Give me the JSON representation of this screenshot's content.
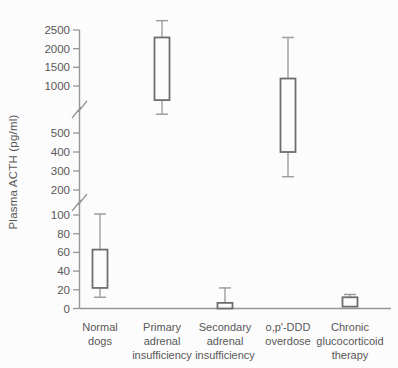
{
  "chart_data": {
    "type": "boxplot",
    "title": "",
    "xlabel": "",
    "ylabel": "Plasma ACTH (pg/ml)",
    "unit": "pg/ml",
    "grid": false,
    "legend": null,
    "categories": [
      "Normal dogs",
      "Primary adrenal insufficiency",
      "Secondary adrenal insufficiency",
      "o,p'-DDD overdose",
      "Chronic glucocorticoid therapy"
    ],
    "category_label_lines": [
      [
        "Normal",
        "dogs"
      ],
      [
        "Primary",
        "adrenal",
        "insufficiency"
      ],
      [
        "Secondary",
        "adrenal",
        "insufficiency"
      ],
      [
        "o,p'-DDD",
        "overdose"
      ],
      [
        "Chronic",
        "glucocorticoid",
        "therapy"
      ]
    ],
    "series": [
      {
        "name": "Normal dogs",
        "whisker_low": 12,
        "box_low": 22,
        "box_high": 63,
        "whisker_high": 104
      },
      {
        "name": "Primary adrenal insufficiency",
        "whisker_low": 700,
        "box_low": 850,
        "box_high": 2300,
        "whisker_high": 2750
      },
      {
        "name": "Secondary adrenal insufficiency",
        "whisker_low": null,
        "box_low": 0,
        "box_high": 6,
        "whisker_high": 22
      },
      {
        "name": "o,p'-DDD overdose",
        "whisker_low": 270,
        "box_low": 400,
        "box_high": 1200,
        "whisker_high": 2300
      },
      {
        "name": "Chronic glucocorticoid therapy",
        "whisker_low": null,
        "box_low": 2,
        "box_high": 12,
        "whisker_high": 15
      }
    ],
    "y_axis": {
      "tick_segments": [
        [
          0,
          20,
          40,
          60,
          80,
          100
        ],
        [
          200,
          300,
          400,
          500
        ],
        [
          1000,
          1500,
          2000,
          2500
        ]
      ],
      "axis_breaks": [
        [
          100,
          200
        ],
        [
          500,
          1000
        ]
      ]
    },
    "colors": {
      "axis_line": "#969696",
      "whisker_line": "#9e9e9e",
      "box_stroke": "#6e6e6e",
      "box_fill": "#fcfcfc",
      "text": "#585858",
      "background": "#fcfcfc"
    }
  }
}
